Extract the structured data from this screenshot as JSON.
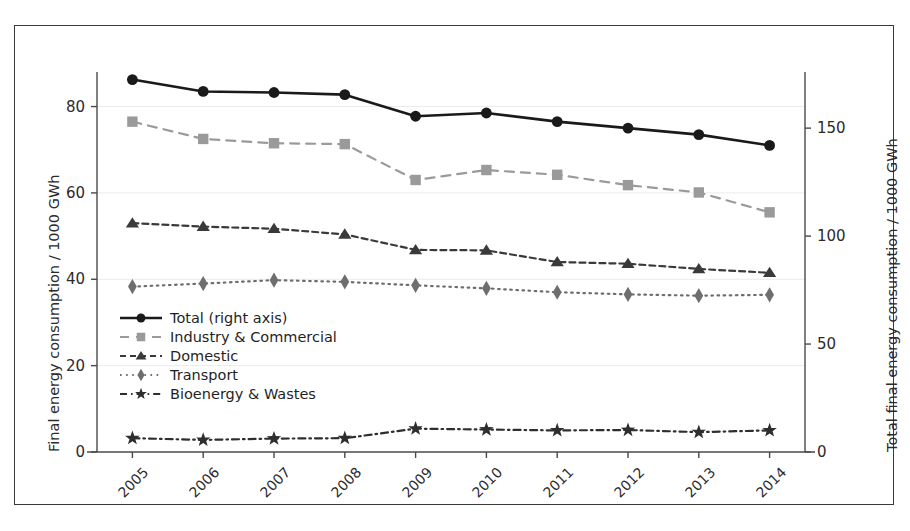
{
  "chart_data": {
    "type": "line",
    "title": "",
    "xlabel": "",
    "ylabel": "Final energy consumption / 1000 GWh",
    "ylabel_right": "Total final energy consumption / 1000 GWh",
    "categories": [
      "2005",
      "2006",
      "2007",
      "2008",
      "2009",
      "2010",
      "2011",
      "2012",
      "2013",
      "2014"
    ],
    "ylim": [
      0,
      88
    ],
    "ylim_right": [
      0,
      176
    ],
    "yticks": [
      0,
      20,
      40,
      60,
      80
    ],
    "yticks_right": [
      0,
      50,
      100,
      150
    ],
    "grid": true,
    "legend_position": "center-left",
    "series": [
      {
        "name": "Total (right axis)",
        "axis": "right",
        "marker": "circle",
        "line_style": "solid",
        "color": "#1a1a1a",
        "values": [
          172.5,
          167.0,
          166.5,
          165.5,
          155.5,
          157.0,
          153.0,
          150.0,
          147.0,
          142.0
        ]
      },
      {
        "name": "Industry & Commercial",
        "axis": "left",
        "marker": "square",
        "line_style": "dashed",
        "color": "#9a9a9a",
        "values": [
          76.5,
          72.5,
          71.5,
          71.3,
          63.0,
          65.3,
          64.2,
          61.8,
          60.1,
          55.5
        ]
      },
      {
        "name": "Domestic",
        "axis": "left",
        "marker": "triangle",
        "line_style": "dashed-tight",
        "color": "#3a3a3a",
        "values": [
          53.0,
          52.2,
          51.7,
          50.4,
          46.8,
          46.7,
          44.0,
          43.6,
          42.4,
          41.5
        ]
      },
      {
        "name": "Transport",
        "axis": "left",
        "marker": "diamond",
        "line_style": "dotted",
        "color": "#6e6e6e",
        "values": [
          38.3,
          39.0,
          39.8,
          39.4,
          38.6,
          37.9,
          37.0,
          36.5,
          36.2,
          36.4
        ]
      },
      {
        "name": "Bioenergy & Wastes",
        "axis": "left",
        "marker": "star",
        "line_style": "dash-dot",
        "color": "#2e2e2e",
        "values": [
          3.2,
          2.8,
          3.1,
          3.2,
          5.4,
          5.2,
          5.0,
          5.1,
          4.6,
          5.0
        ]
      }
    ]
  },
  "axes": {
    "left_title": "Final energy consumption / 1000 GWh",
    "right_title": "Total final energy consumption / 1000 GWh",
    "left_ticks": [
      "0",
      "20",
      "40",
      "60",
      "80"
    ],
    "right_ticks": [
      "0",
      "50",
      "100",
      "150"
    ],
    "x_ticks": [
      "2005",
      "2006",
      "2007",
      "2008",
      "2009",
      "2010",
      "2011",
      "2012",
      "2013",
      "2014"
    ]
  },
  "legend": {
    "items": [
      {
        "label": "Total (right axis)"
      },
      {
        "label": "Industry & Commercial"
      },
      {
        "label": "Domestic"
      },
      {
        "label": "Transport"
      },
      {
        "label": "Bioenergy & Wastes"
      }
    ]
  },
  "colors": {
    "total": "#1a1a1a",
    "industry": "#9a9a9a",
    "domestic": "#3a3a3a",
    "transport": "#6e6e6e",
    "bioenergy": "#2e2e2e",
    "axis": "#4a4a4a",
    "grid": "#ebebeb",
    "frame": "#3a3a3a"
  }
}
